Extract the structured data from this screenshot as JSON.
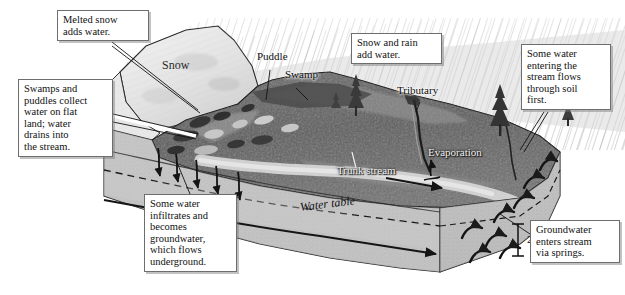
{
  "figure": {
    "width": 625,
    "height": 295,
    "background": "#ffffff"
  },
  "palette": {
    "paper": "#ffffff",
    "box_border": "#6e6e6e",
    "ink": "#111111",
    "snow_light": "#ededed",
    "rain_gray": "#b9b9b9",
    "terrain_dark": "#585858",
    "terrain_mid": "#7d7d7d",
    "soil_light": "#c2c2c2",
    "soil_pale": "#d4d4d4",
    "stream_pale": "#cfcfcf",
    "leader_line": "#1a1a1a"
  },
  "callouts": [
    {
      "id": "melted-snow",
      "name": "callout-melted-snow",
      "lines": [
        "Melted snow",
        "adds water."
      ],
      "x": 57,
      "y": 10,
      "w": 92,
      "h": 33
    },
    {
      "id": "swamps-puddles",
      "name": "callout-swamps-puddles",
      "lines": [
        "Swamps and",
        "puddles collect",
        "water on flat",
        "land; water",
        "drains into",
        "the stream."
      ],
      "x": 18,
      "y": 79,
      "w": 95,
      "h": 80
    },
    {
      "id": "infiltrates",
      "name": "callout-infiltration",
      "lines": [
        "Some water",
        "infiltrates and",
        "becomes",
        "groundwater,",
        "which flows",
        "underground."
      ],
      "x": 144,
      "y": 194,
      "w": 93,
      "h": 80
    },
    {
      "id": "snow-and-rain",
      "name": "callout-snow-and-rain",
      "lines": [
        "Snow and rain",
        "add water."
      ],
      "x": 351,
      "y": 33,
      "w": 91,
      "h": 33
    },
    {
      "id": "through-soil",
      "name": "callout-through-soil",
      "lines": [
        "Some water",
        "entering the",
        "stream flows",
        "through soil",
        "first."
      ],
      "x": 521,
      "y": 44,
      "w": 90,
      "h": 68
    },
    {
      "id": "springs",
      "name": "callout-groundwater-springs",
      "lines": [
        "Groundwater",
        "enters stream",
        "via springs."
      ],
      "x": 530,
      "y": 220,
      "w": 90,
      "h": 46
    }
  ],
  "labels": [
    {
      "id": "snow",
      "name": "label-snow",
      "text": "Snow",
      "x": 162,
      "y": 64,
      "style": "snow"
    },
    {
      "id": "puddle",
      "name": "label-puddle",
      "text": "Puddle",
      "x": 257,
      "y": 56,
      "style": "dark"
    },
    {
      "id": "swamp",
      "name": "label-swamp",
      "text": "Swamp",
      "x": 285,
      "y": 74,
      "style": "dark"
    },
    {
      "id": "tributary",
      "name": "label-tributary",
      "text": "Tributary",
      "x": 397,
      "y": 90,
      "style": "dark"
    },
    {
      "id": "trunkstream",
      "name": "label-trunk-stream",
      "text": "Trunk stream",
      "x": 337,
      "y": 170,
      "style": "light"
    },
    {
      "id": "evaporation",
      "name": "label-evaporation",
      "text": "Evaporation",
      "x": 428,
      "y": 152,
      "style": "light"
    },
    {
      "id": "watertable",
      "name": "label-water-table",
      "text": "Water table",
      "x": 300,
      "y": 207,
      "style": "italic"
    }
  ],
  "scale_bar": {
    "name": "scale-bar",
    "value": "2 m",
    "x": 512,
    "y": 222,
    "height": 34
  }
}
